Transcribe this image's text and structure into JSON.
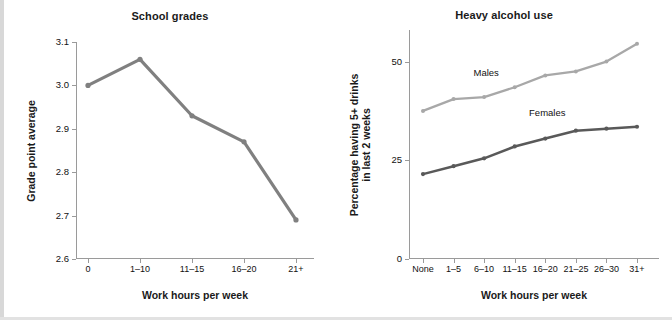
{
  "figure": {
    "cut_caption": "Figure fragment — partially visible text row at top of page"
  },
  "panels": {
    "left": {
      "title": "School grades",
      "xlabel": "Work hours per week",
      "ylabel": "Grade point average",
      "yticks": [
        "2.6",
        "2.7",
        "2.8",
        "2.9",
        "3.0",
        "3.1"
      ],
      "xticks": [
        "0",
        "1–10",
        "11–15",
        "16–20",
        "21+"
      ]
    },
    "right": {
      "title": "Heavy alcohol use",
      "xlabel": "Work hours per week",
      "ylabel_line1": "Percentage having 5+ drinks",
      "ylabel_line2": "in last 2 weeks",
      "yticks": [
        "0",
        "25",
        "50"
      ],
      "xticks": [
        "None",
        "1–5",
        "6–10",
        "11–15",
        "16–20",
        "21–25",
        "26–30",
        "31+"
      ],
      "series_labels": {
        "males": "Males",
        "females": "Females"
      }
    }
  },
  "colors": {
    "gpa_line": "#808080",
    "males_line": "#a8a8a8",
    "females_line": "#595959",
    "axis": "#9a9a9a",
    "text": "#111111"
  },
  "chart_data": [
    {
      "type": "line",
      "title": "School grades",
      "xlabel": "Work hours per week",
      "ylabel": "Grade point average",
      "categories": [
        "0",
        "1–10",
        "11–15",
        "16–20",
        "21+"
      ],
      "values": [
        3.0,
        3.06,
        2.93,
        2.87,
        2.69
      ],
      "ylim": [
        2.6,
        3.1
      ],
      "yticks": [
        2.6,
        2.7,
        2.8,
        2.9,
        3.0,
        3.1
      ],
      "grid": false,
      "legend": "none"
    },
    {
      "type": "line",
      "title": "Heavy alcohol use",
      "xlabel": "Work hours per week",
      "ylabel": "Percentage having 5+ drinks in last 2 weeks",
      "categories": [
        "None",
        "1–5",
        "6–10",
        "11–15",
        "16–20",
        "21–25",
        "26–30",
        "31+"
      ],
      "series": [
        {
          "name": "Males",
          "values": [
            37.5,
            40.5,
            41,
            43.5,
            46.5,
            47.5,
            50,
            54.5
          ]
        },
        {
          "name": "Females",
          "values": [
            21.5,
            23.5,
            25.5,
            28.5,
            30.5,
            32.5,
            33,
            33.5
          ]
        }
      ],
      "ylim": [
        0,
        58
      ],
      "yticks": [
        0,
        25,
        50
      ],
      "grid": false,
      "legend": "inline-labels"
    }
  ]
}
